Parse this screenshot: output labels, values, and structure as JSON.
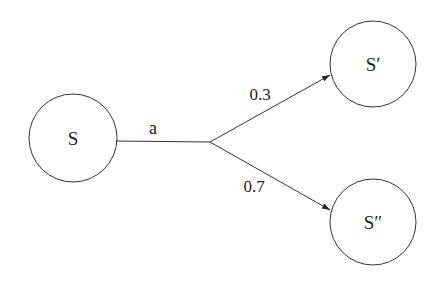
{
  "diagram": {
    "type": "probabilistic-transition",
    "nodes": [
      {
        "id": "S",
        "label": "S"
      },
      {
        "id": "S1",
        "label": "S′"
      },
      {
        "id": "S2",
        "label": "S″"
      }
    ],
    "action": {
      "label": "a"
    },
    "edges": [
      {
        "from": "S",
        "to": "S1",
        "probability": "0.3"
      },
      {
        "from": "S",
        "to": "S2",
        "probability": "0.7"
      }
    ],
    "colors": {
      "stroke": "#333333",
      "text": "#222222",
      "background": "#ffffff"
    }
  }
}
